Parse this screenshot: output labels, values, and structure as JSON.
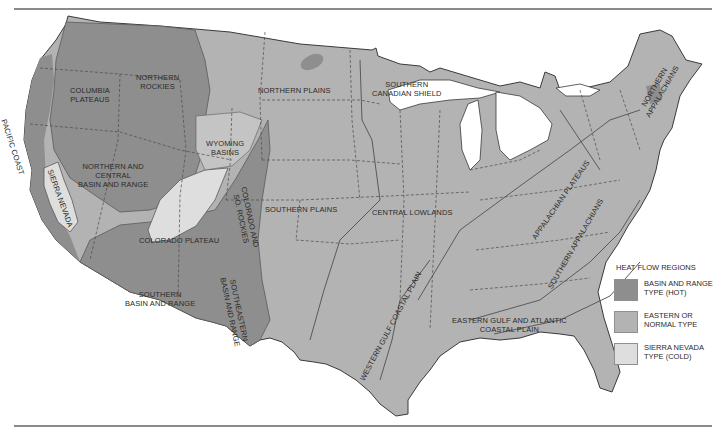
{
  "map": {
    "colors": {
      "hot": "#8e8e8e",
      "normal": "#b3b3b3",
      "cold": "#dedede",
      "boundary": "#555555",
      "background": "#ffffff"
    },
    "region_labels": {
      "pacific_coast": "PACIFIC COAST",
      "columbia_plateaus": "COLUMBIA\nPLATEAUS",
      "northern_rockies": "NORTHERN\nROCKIES",
      "northern_plains": "NORTHERN PLAINS",
      "southern_canadian_shield": "SOUTHERN\nCANADIAN SHIELD",
      "northern_appalachians": "NORTHERN\nAPPALACHIANS",
      "wyoming_basins": "WYOMING\nBASINS",
      "northern_central_basin_range": "NORTHERN AND\nCENTRAL\nBASIN AND RANGE",
      "sierra_nevada": "SIERRA NEVADA",
      "colorado_so_rockies": "COLORADO AND\nSO. ROCKIES",
      "southern_plains": "SOUTHERN PLAINS",
      "central_lowlands": "CENTRAL LOWLANDS",
      "appalachian_plateaus": "APPALACHIAN PLATEAUS",
      "colorado_plateau": "COLORADO PLATEAU",
      "southern_basin_range": "SOUTHERN\nBASIN AND RANGE",
      "southeastern_basin_range": "SOUTHEASTERN\nBASIN AND RANGE",
      "southern_appalachians": "SOUTHERN APPALACHIANS",
      "western_gulf_coastal_plain": "WESTERN GULF COASTAL PLAIN",
      "eastern_gulf_atlantic_coastal_plain": "EASTERN GULF AND ATLANTIC\nCOASTAL PLAIN"
    }
  },
  "legend": {
    "title": "HEAT FLOW REGIONS",
    "items": [
      {
        "label": "BASIN AND RANGE\nTYPE (HOT)",
        "color": "#8e8e8e"
      },
      {
        "label": "EASTERN OR\nNORMAL TYPE",
        "color": "#b3b3b3"
      },
      {
        "label": "SIERRA NEVADA\nTYPE (COLD)",
        "color": "#dedede"
      }
    ]
  }
}
